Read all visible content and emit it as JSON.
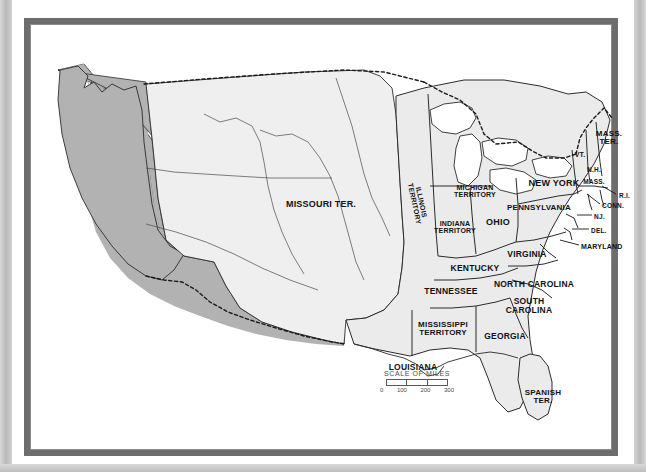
{
  "document": {
    "type": "historical-map",
    "subject": "United States political map, circa 1812",
    "frame_color": "#6d6d6d",
    "page_background": "#ffffff"
  },
  "map": {
    "fill_state": "#ebebeb",
    "fill_territory": "#efefef",
    "fill_foreign": "#b2b2b2",
    "water": "#ffffff",
    "outline": "#2b2b2b",
    "labels": [
      {
        "id": "missouri-ter",
        "text": "MISSOURI TER.",
        "x": 297,
        "y": 187,
        "size": 9,
        "rotate": 0,
        "align": "center"
      },
      {
        "id": "illinois-territory",
        "text": "ILLINOIS\nTERRITORY",
        "x": 394,
        "y": 185,
        "size": 7,
        "rotate": 78,
        "align": "center"
      },
      {
        "id": "michigan-territory",
        "text": "MICHIGAN\nTERRITORY",
        "x": 451,
        "y": 173,
        "size": 7,
        "rotate": 0,
        "align": "center"
      },
      {
        "id": "indiana-territory",
        "text": "INDIANA\nTERRITORY",
        "x": 431,
        "y": 209,
        "size": 7,
        "rotate": 0,
        "align": "center"
      },
      {
        "id": "ohio",
        "text": "OHIO",
        "x": 474,
        "y": 205,
        "size": 9,
        "rotate": 0,
        "align": "center"
      },
      {
        "id": "kentucky",
        "text": "KENTUCKY",
        "x": 451,
        "y": 250,
        "size": 8.5,
        "rotate": 0,
        "align": "center"
      },
      {
        "id": "tennessee",
        "text": "TENNESSEE",
        "x": 427,
        "y": 273,
        "size": 8.5,
        "rotate": 0,
        "align": "center"
      },
      {
        "id": "virginia",
        "text": "VIRGINIA",
        "x": 503,
        "y": 236,
        "size": 8.5,
        "rotate": 0,
        "align": "center"
      },
      {
        "id": "north-carolina",
        "text": "NORTH CAROLINA",
        "x": 510,
        "y": 266,
        "size": 8.5,
        "rotate": 0,
        "align": "center"
      },
      {
        "id": "south-carolina",
        "text": "SOUTH\nCAROLINA",
        "x": 505,
        "y": 288,
        "size": 8.5,
        "rotate": 0,
        "align": "center"
      },
      {
        "id": "georgia",
        "text": "GEORGIA",
        "x": 481,
        "y": 318,
        "size": 8.5,
        "rotate": 0,
        "align": "center"
      },
      {
        "id": "mississippi-territory",
        "text": "MISSISSIPPI\nTERRITORY",
        "x": 419,
        "y": 311,
        "size": 8,
        "rotate": 0,
        "align": "center"
      },
      {
        "id": "louisiana",
        "text": "LOUISIANA",
        "x": 389,
        "y": 349,
        "size": 8.5,
        "rotate": 0,
        "align": "center"
      },
      {
        "id": "spanish-ter",
        "text": "SPANISH\nTER.",
        "x": 519,
        "y": 379,
        "size": 8,
        "rotate": 0,
        "align": "center"
      },
      {
        "id": "new-york",
        "text": "NEW YORK",
        "x": 530,
        "y": 166,
        "size": 9,
        "rotate": 0,
        "align": "center"
      },
      {
        "id": "pennsylvania",
        "text": "PENNSYLVANIA",
        "x": 515,
        "y": 190,
        "size": 8,
        "rotate": 0,
        "align": "center"
      },
      {
        "id": "mass-ter",
        "text": "MASS.\nTER.",
        "x": 585,
        "y": 120,
        "size": 8,
        "rotate": 0,
        "align": "center"
      },
      {
        "id": "vermont",
        "text": "VT.",
        "x": 556,
        "y": 137,
        "size": 7,
        "rotate": 0,
        "align": "center"
      },
      {
        "id": "new-hampshire",
        "text": "N.H.",
        "x": 570,
        "y": 152,
        "size": 6.5,
        "rotate": 0,
        "align": "center"
      },
      {
        "id": "massachusetts",
        "text": "MASS.",
        "x": 570,
        "y": 164,
        "size": 6.5,
        "rotate": 0,
        "align": "center"
      },
      {
        "id": "rhode-island",
        "text": "R.I.",
        "x": 595,
        "y": 178,
        "size": 6.5,
        "rotate": 0,
        "align": "left"
      },
      {
        "id": "connecticut",
        "text": "CONN.",
        "x": 578,
        "y": 188,
        "size": 6.5,
        "rotate": 0,
        "align": "left"
      },
      {
        "id": "new-jersey",
        "text": "NJ.",
        "x": 570,
        "y": 199,
        "size": 6.5,
        "rotate": 0,
        "align": "left"
      },
      {
        "id": "delaware",
        "text": "DEL.",
        "x": 567,
        "y": 213,
        "size": 6.5,
        "rotate": 0,
        "align": "left"
      },
      {
        "id": "maryland",
        "text": "MARYLAND",
        "x": 557,
        "y": 229,
        "size": 7,
        "rotate": 0,
        "align": "left"
      }
    ],
    "leaders": [
      {
        "id": "leader-rhode-island",
        "x1": 592,
        "y1": 176,
        "x2": 578,
        "y2": 168
      },
      {
        "id": "leader-connecticut",
        "x1": 576,
        "y1": 186,
        "x2": 563,
        "y2": 176
      },
      {
        "id": "leader-new-jersey",
        "x1": 568,
        "y1": 197,
        "x2": 553,
        "y2": 197
      },
      {
        "id": "leader-delaware",
        "x1": 565,
        "y1": 211,
        "x2": 548,
        "y2": 211
      },
      {
        "id": "leader-maryland",
        "x1": 555,
        "y1": 227,
        "x2": 536,
        "y2": 222
      }
    ]
  },
  "scale": {
    "title": "SCALE OF MILES",
    "ticks": [
      "0",
      "100",
      "200",
      "300"
    ],
    "units": "miles",
    "segments": 3
  }
}
